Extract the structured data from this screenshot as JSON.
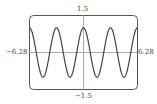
{
  "chart_data": {
    "type": "line",
    "title": "",
    "xlabel": "",
    "ylabel": "",
    "xlim": [
      -6.28,
      6.28
    ],
    "ylim": [
      -1.5,
      1.5
    ],
    "grid": false,
    "function": "cos(2x)",
    "x_tick_labels": [
      "-6.28",
      "6.28"
    ],
    "y_tick_labels": [
      "1.5",
      "-1.5"
    ],
    "series": [
      {
        "name": "y = cos(2x)",
        "amplitude": 1,
        "periods_shown": 4,
        "x": [
          -6.28,
          -4.71,
          -3.14,
          -1.57,
          0,
          1.57,
          3.14,
          4.71,
          6.28
        ],
        "values": [
          1,
          -1,
          1,
          -1,
          1,
          -1,
          1,
          -1,
          1
        ]
      }
    ]
  },
  "labels": {
    "ymax": "1.5",
    "ymin": "−1.5",
    "xmin": "−6.28",
    "xmax": "6.28"
  },
  "colors": {
    "curve": "#444444",
    "frame": "#555555",
    "axis": "#aaaaaa"
  }
}
